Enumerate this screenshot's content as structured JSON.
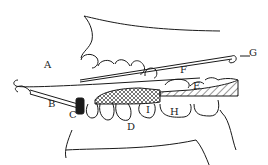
{
  "diagram": {
    "type": "dental-appliance-illustration",
    "labels": [
      {
        "id": "A",
        "text": "A"
      },
      {
        "id": "B",
        "text": "B"
      },
      {
        "id": "C",
        "text": "C"
      },
      {
        "id": "D",
        "text": "D"
      },
      {
        "id": "E",
        "text": "E"
      },
      {
        "id": "F",
        "text": "F"
      },
      {
        "id": "G",
        "text": "G"
      },
      {
        "id": "H",
        "text": "H"
      },
      {
        "id": "I",
        "text": "I"
      }
    ],
    "colors": {
      "line": "#1a1a1a",
      "background": "#ffffff"
    }
  }
}
